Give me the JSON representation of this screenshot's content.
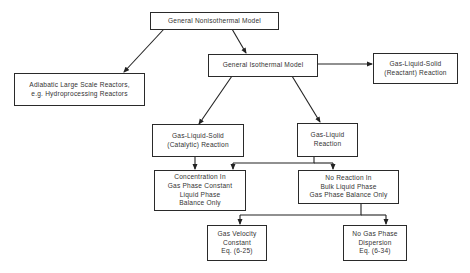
{
  "diagram": {
    "type": "flowchart",
    "nodes": {
      "nonisothermal": {
        "label": "General  Nonisothermal  Model"
      },
      "adiabatic": {
        "label": "Adiabatic  Large Scale  Reactors,\ne.g.  Hydroprocessing  Reactors"
      },
      "isothermal": {
        "label": "General  Isothermal  Model"
      },
      "reactant": {
        "label": "Gas-Liquid-Solid\n(Reactant)  Reaction"
      },
      "catalytic": {
        "label": "Gas-Liquid-Solid\n(Catalytic)  Reaction"
      },
      "gas_liquid": {
        "label": "Gas-Liquid\nReaction"
      },
      "concentration": {
        "label": "Concentration  In\nGas Phase  Constant\nLiquid  Phase\nBalance  Only"
      },
      "no_reaction": {
        "label": "No  Reaction  In\nBulk  Liquid  Phase\nGas  Phase  Balance  Only"
      },
      "gas_velocity": {
        "label": "Gas  Velocity\nConstant\nEq.  (6-25)"
      },
      "no_dispersion": {
        "label": "No  Gas  Phase\nDispersion\nEq.  (6-34)"
      }
    },
    "edges": [
      [
        "nonisothermal",
        "adiabatic"
      ],
      [
        "nonisothermal",
        "isothermal"
      ],
      [
        "isothermal",
        "reactant"
      ],
      [
        "isothermal",
        "catalytic"
      ],
      [
        "isothermal",
        "gas_liquid"
      ],
      [
        "catalytic",
        "concentration"
      ],
      [
        "gas_liquid",
        "concentration"
      ],
      [
        "gas_liquid",
        "no_reaction"
      ],
      [
        "no_reaction",
        "gas_velocity"
      ],
      [
        "no_reaction",
        "no_dispersion"
      ]
    ]
  }
}
